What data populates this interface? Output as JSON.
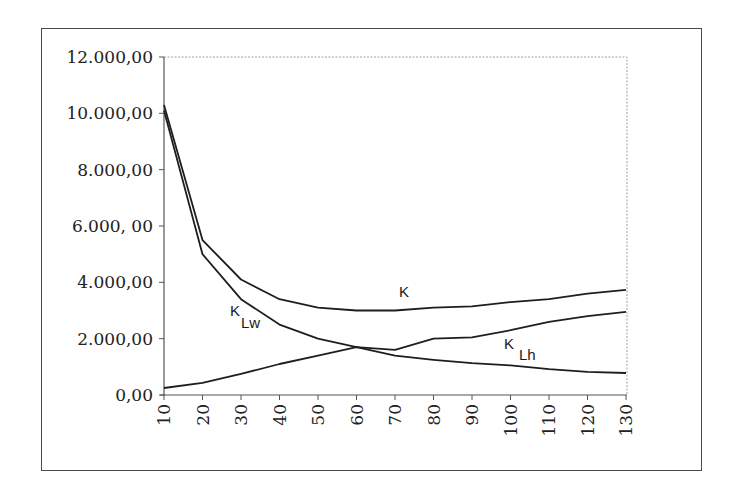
{
  "chart_data": {
    "type": "line",
    "title": "",
    "xlabel": "",
    "ylabel": "",
    "x": [
      10,
      20,
      30,
      40,
      50,
      60,
      70,
      80,
      90,
      100,
      110,
      120,
      130
    ],
    "x_tick_labels": [
      "10",
      "20",
      "30",
      "40",
      "50",
      "60",
      "70",
      "80",
      "90",
      "100",
      "110",
      "120",
      "130"
    ],
    "y_tick_values": [
      0,
      2000,
      4000,
      6000,
      8000,
      10000,
      12000
    ],
    "y_tick_labels": [
      "0,00",
      "2.000,00",
      "4.000,00",
      "6.000, 00",
      "8.000,00",
      "10.000,00",
      "12.000,00"
    ],
    "ylim": [
      0,
      12000
    ],
    "xlim": [
      10,
      130
    ],
    "grid": false,
    "legend": "none (inline labels)",
    "series": [
      {
        "name": "K",
        "label_main": "K",
        "label_sub": "",
        "values": [
          10300,
          5500,
          4100,
          3400,
          3100,
          3000,
          3000,
          3100,
          3150,
          3300,
          3400,
          3600,
          3730
        ]
      },
      {
        "name": "K_Lw",
        "label_main": "K",
        "label_sub": "Lw",
        "values": [
          10100,
          5000,
          3400,
          2500,
          2000,
          1700,
          1400,
          1250,
          1130,
          1050,
          920,
          820,
          780
        ]
      },
      {
        "name": "K_Lh",
        "label_main": "K",
        "label_sub": "Lh",
        "values": [
          250,
          430,
          750,
          1100,
          1400,
          1700,
          1600,
          2000,
          2050,
          2300,
          2600,
          2800,
          2950
        ]
      }
    ],
    "annotations": [
      {
        "text": "K",
        "series": "K",
        "x_px": 400,
        "y_px": 296
      },
      {
        "text": "K_Lw",
        "series": "K_Lw",
        "x_px": 231,
        "y_px": 316
      },
      {
        "text": "K_Lh",
        "series": "K_Lh",
        "x_px": 505,
        "y_px": 350
      }
    ]
  },
  "colors": {
    "line": "#1e1e1e",
    "frame": "#4a4a4a",
    "plot_border": "#9a9a9a"
  }
}
